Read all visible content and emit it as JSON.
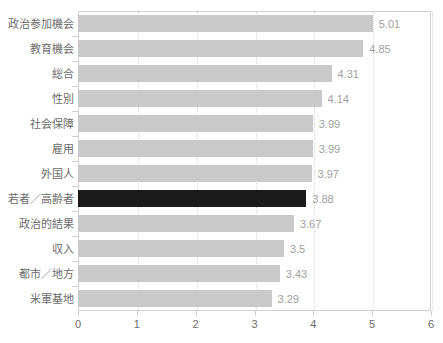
{
  "chart_data": {
    "type": "bar",
    "orientation": "horizontal",
    "title": "",
    "subtitle": "",
    "xlabel": "",
    "ylabel": "",
    "xlim": [
      0,
      6
    ],
    "xticks": [
      0,
      1,
      2,
      3,
      4,
      5,
      6
    ],
    "xtick_labels": [
      "0",
      "1",
      "2",
      "3",
      "4",
      "5",
      "6"
    ],
    "grid": "vertical-dotted",
    "legend": "none",
    "categories": [
      "政治参加機会",
      "教育機会",
      "総合",
      "性別",
      "社会保障",
      "雇用",
      "外国人",
      "若者／高齢者",
      "政治的結果",
      "収入",
      "都市／地方",
      "米軍基地"
    ],
    "values": [
      5.01,
      4.85,
      4.31,
      4.14,
      3.99,
      3.99,
      3.97,
      3.88,
      3.67,
      3.5,
      3.43,
      3.29
    ],
    "value_labels": [
      "5.01",
      "4.85",
      "4.31",
      "4.14",
      "3.99",
      "3.99",
      "3.97",
      "3.88",
      "3.67",
      "3.5",
      "3.43",
      "3.29"
    ],
    "highlight_index": 7,
    "colors": {
      "bar": "#c9c9c9",
      "bar_highlight": "#1a1a1a",
      "value_text": "#a0a0a0",
      "category_text": "#6b6b6b",
      "axis_text": "#6b6b6b",
      "axis_line": "#d0d0d0",
      "gridline": "#d8d8d8",
      "background": "#ffffff"
    }
  }
}
